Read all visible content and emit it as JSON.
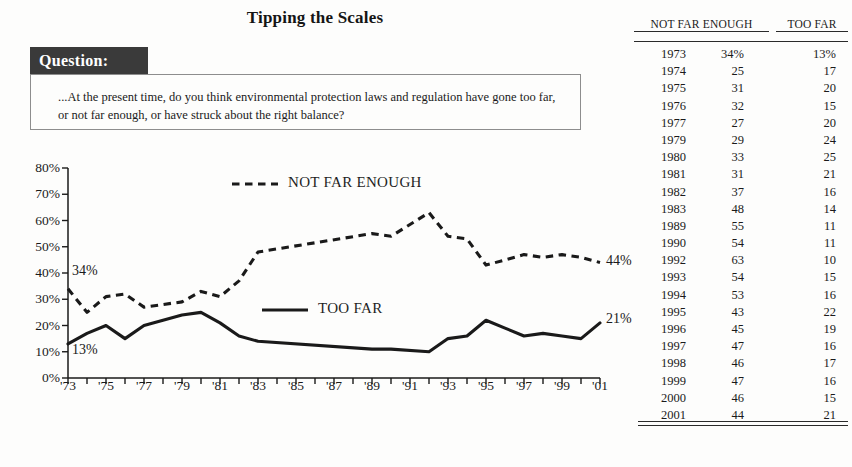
{
  "title": "Tipping the Scales",
  "question": {
    "tab_label": "Question:",
    "text": "...At the present time, do you think environmental protection laws and regulation have gone too far, or not far enough, or have struck about the right balance?"
  },
  "series_labels": {
    "not_far_enough": "NOT FAR ENOUGH",
    "too_far": "TOO FAR"
  },
  "endpoints": {
    "nfe_start": "34%",
    "tf_start": "13%",
    "nfe_end": "44%",
    "tf_end": "21%"
  },
  "table": {
    "headers": {
      "year": "",
      "not_far_enough": "NOT FAR ENOUGH",
      "too_far": "TOO FAR"
    },
    "rows": [
      {
        "year": "1973",
        "nfe": "34%",
        "tf": "13%"
      },
      {
        "year": "1974",
        "nfe": "25",
        "tf": "17"
      },
      {
        "year": "1975",
        "nfe": "31",
        "tf": "20"
      },
      {
        "year": "1976",
        "nfe": "32",
        "tf": "15"
      },
      {
        "year": "1977",
        "nfe": "27",
        "tf": "20"
      },
      {
        "year": "1979",
        "nfe": "29",
        "tf": "24"
      },
      {
        "year": "1980",
        "nfe": "33",
        "tf": "25"
      },
      {
        "year": "1981",
        "nfe": "31",
        "tf": "21"
      },
      {
        "year": "1982",
        "nfe": "37",
        "tf": "16"
      },
      {
        "year": "1983",
        "nfe": "48",
        "tf": "14"
      },
      {
        "year": "1989",
        "nfe": "55",
        "tf": "11"
      },
      {
        "year": "1990",
        "nfe": "54",
        "tf": "11"
      },
      {
        "year": "1992",
        "nfe": "63",
        "tf": "10"
      },
      {
        "year": "1993",
        "nfe": "54",
        "tf": "15"
      },
      {
        "year": "1994",
        "nfe": "53",
        "tf": "16"
      },
      {
        "year": "1995",
        "nfe": "43",
        "tf": "22"
      },
      {
        "year": "1996",
        "nfe": "45",
        "tf": "19"
      },
      {
        "year": "1997",
        "nfe": "47",
        "tf": "16"
      },
      {
        "year": "1998",
        "nfe": "46",
        "tf": "17"
      },
      {
        "year": "1999",
        "nfe": "47",
        "tf": "16"
      },
      {
        "year": "2000",
        "nfe": "46",
        "tf": "15"
      },
      {
        "year": "2001",
        "nfe": "44",
        "tf": "21"
      }
    ]
  },
  "chart_data": {
    "type": "line",
    "title": "Tipping the Scales",
    "xlabel": "",
    "ylabel": "",
    "ylim": [
      0,
      80
    ],
    "yticks": [
      0,
      10,
      20,
      30,
      40,
      50,
      60,
      70,
      80
    ],
    "ytick_labels": [
      "0%",
      "10%",
      "20%",
      "30%",
      "40%",
      "50%",
      "60%",
      "70%",
      "80%"
    ],
    "xlim": [
      1973,
      2001
    ],
    "xticks": [
      1973,
      1975,
      1977,
      1979,
      1981,
      1983,
      1985,
      1987,
      1989,
      1991,
      1993,
      1995,
      1997,
      1999,
      2001
    ],
    "xtick_labels": [
      "'73",
      "'75",
      "'77",
      "'79",
      "'81",
      "'83",
      "'85",
      "'87",
      "'89",
      "'91",
      "'93",
      "'95",
      "'97",
      "'99",
      "'01"
    ],
    "grid": false,
    "legend": "inline",
    "x": [
      1973,
      1974,
      1975,
      1976,
      1977,
      1979,
      1980,
      1981,
      1982,
      1983,
      1989,
      1990,
      1992,
      1993,
      1994,
      1995,
      1996,
      1997,
      1998,
      1999,
      2000,
      2001
    ],
    "series": [
      {
        "name": "NOT FAR ENOUGH",
        "style": "dashed",
        "color": "#1a1a1a",
        "values": [
          34,
          25,
          31,
          32,
          27,
          29,
          33,
          31,
          37,
          48,
          55,
          54,
          63,
          54,
          53,
          43,
          45,
          47,
          46,
          47,
          46,
          44
        ]
      },
      {
        "name": "TOO FAR",
        "style": "solid",
        "color": "#1a1a1a",
        "values": [
          13,
          17,
          20,
          15,
          20,
          24,
          25,
          21,
          16,
          14,
          11,
          11,
          10,
          15,
          16,
          22,
          19,
          16,
          17,
          16,
          15,
          21
        ]
      }
    ]
  }
}
